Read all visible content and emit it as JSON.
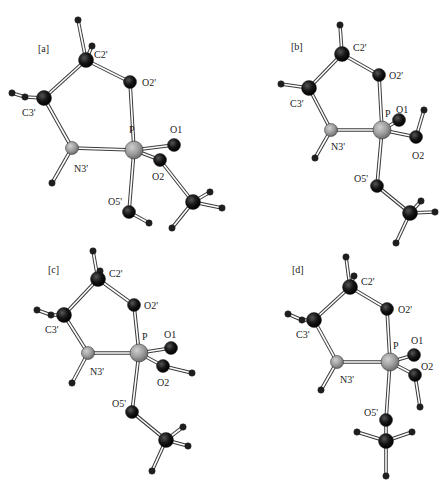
{
  "figure": {
    "colors": {
      "oxygen_carbon": "#111111",
      "nitrogen_phosphorus": "#9a9a9a",
      "hydrogen": "#222222",
      "bond_outline": "#444444",
      "bond_fill": "#ffffff"
    },
    "panels": [
      {
        "label": "[a]",
        "label_pos": [
          38,
          52
        ],
        "atoms": [
          {
            "id": "H1",
            "el": "H",
            "x": 78,
            "y": 20
          },
          {
            "id": "H2",
            "el": "H",
            "x": 92,
            "y": 46
          },
          {
            "id": "C2'",
            "el": "C",
            "x": 86,
            "y": 60,
            "label": "C2'",
            "lx": 94,
            "ly": 58
          },
          {
            "id": "O2'",
            "el": "O",
            "x": 130,
            "y": 82,
            "label": "O2'",
            "lx": 142,
            "ly": 86
          },
          {
            "id": "H3",
            "el": "H",
            "x": 12,
            "y": 93
          },
          {
            "id": "H4",
            "el": "H",
            "x": 25,
            "y": 97
          },
          {
            "id": "C3'",
            "el": "C",
            "x": 44,
            "y": 98,
            "label": "C3'",
            "lx": 22,
            "ly": 116
          },
          {
            "id": "N3'",
            "el": "N",
            "x": 72,
            "y": 148,
            "label": "N3'",
            "lx": 74,
            "ly": 172
          },
          {
            "id": "H5",
            "el": "H",
            "x": 52,
            "y": 183
          },
          {
            "id": "P",
            "el": "P",
            "x": 134,
            "y": 150,
            "label": "P",
            "lx": 129,
            "ly": 133
          },
          {
            "id": "O1",
            "el": "O",
            "x": 174,
            "y": 145,
            "label": "O1",
            "lx": 170,
            "ly": 133
          },
          {
            "id": "O2",
            "el": "O",
            "x": 160,
            "y": 160,
            "label": "O2",
            "lx": 152,
            "ly": 180
          },
          {
            "id": "O5'",
            "el": "O",
            "x": 129,
            "y": 212,
            "label": "O5'",
            "lx": 108,
            "ly": 205
          },
          {
            "id": "H6",
            "el": "H",
            "x": 149,
            "y": 223
          },
          {
            "id": "C",
            "el": "C",
            "x": 193,
            "y": 202
          },
          {
            "id": "H7",
            "el": "H",
            "x": 210,
            "y": 192
          },
          {
            "id": "H8",
            "el": "H",
            "x": 222,
            "y": 208
          },
          {
            "id": "H9",
            "el": "H",
            "x": 172,
            "y": 228
          }
        ],
        "bonds": [
          [
            "H1",
            "C2'"
          ],
          [
            "H2",
            "C2'"
          ],
          [
            "C2'",
            "O2'"
          ],
          [
            "C2'",
            "C3'"
          ],
          [
            "H3",
            "H4"
          ],
          [
            "H4",
            "C3'"
          ],
          [
            "C3'",
            "N3'"
          ],
          [
            "N3'",
            "P"
          ],
          [
            "N3'",
            "H5"
          ],
          [
            "O2'",
            "P"
          ],
          [
            "P",
            "O1"
          ],
          [
            "P",
            "O2"
          ],
          [
            "P",
            "O5'"
          ],
          [
            "O5'",
            "H6"
          ],
          [
            "O2",
            "C"
          ],
          [
            "C",
            "H7"
          ],
          [
            "C",
            "H8"
          ],
          [
            "C",
            "H9"
          ]
        ]
      },
      {
        "label": "[b]",
        "label_pos": [
          291,
          50
        ],
        "atoms": [
          {
            "id": "H1",
            "el": "H",
            "x": 340,
            "y": 25
          },
          {
            "id": "C2'",
            "el": "C",
            "x": 342,
            "y": 54,
            "label": "C2'",
            "lx": 353,
            "ly": 51
          },
          {
            "id": "O2'",
            "el": "O",
            "x": 379,
            "y": 75,
            "label": "O2'",
            "lx": 389,
            "ly": 79
          },
          {
            "id": "H2",
            "el": "H",
            "x": 281,
            "y": 84
          },
          {
            "id": "C3'",
            "el": "C",
            "x": 309,
            "y": 88,
            "label": "C3'",
            "lx": 290,
            "ly": 107
          },
          {
            "id": "N3'",
            "el": "N",
            "x": 331,
            "y": 130,
            "label": "N3'",
            "lx": 331,
            "ly": 150
          },
          {
            "id": "H3",
            "el": "H",
            "x": 315,
            "y": 158
          },
          {
            "id": "P",
            "el": "P",
            "x": 382,
            "y": 130,
            "label": "P",
            "lx": 385,
            "ly": 117
          },
          {
            "id": "O1",
            "el": "O",
            "x": 399,
            "y": 120,
            "label": "O1",
            "lx": 396,
            "ly": 113
          },
          {
            "id": "H4",
            "el": "H",
            "x": 424,
            "y": 110
          },
          {
            "id": "O2",
            "el": "O",
            "x": 416,
            "y": 137,
            "label": "O2",
            "lx": 412,
            "ly": 159
          },
          {
            "id": "O5'",
            "el": "O",
            "x": 377,
            "y": 186,
            "label": "O5'",
            "lx": 354,
            "ly": 182
          },
          {
            "id": "C",
            "el": "C",
            "x": 410,
            "y": 213
          },
          {
            "id": "H5",
            "el": "H",
            "x": 421,
            "y": 201
          },
          {
            "id": "H6",
            "el": "H",
            "x": 435,
            "y": 212
          },
          {
            "id": "H7",
            "el": "H",
            "x": 396,
            "y": 243
          }
        ],
        "bonds": [
          [
            "H1",
            "C2'"
          ],
          [
            "C2'",
            "O2'"
          ],
          [
            "C2'",
            "C3'"
          ],
          [
            "H2",
            "C3'"
          ],
          [
            "C3'",
            "N3'"
          ],
          [
            "N3'",
            "P"
          ],
          [
            "N3'",
            "H3"
          ],
          [
            "O2'",
            "P"
          ],
          [
            "P",
            "O1"
          ],
          [
            "P",
            "O2"
          ],
          [
            "O2",
            "H4"
          ],
          [
            "P",
            "O5'"
          ],
          [
            "O5'",
            "C"
          ],
          [
            "C",
            "H5"
          ],
          [
            "C",
            "H6"
          ],
          [
            "C",
            "H7"
          ]
        ]
      },
      {
        "label": "[c]",
        "label_pos": [
          48,
          273
        ],
        "atoms": [
          {
            "id": "H1",
            "el": "H",
            "x": 93,
            "y": 251
          },
          {
            "id": "H2",
            "el": "H",
            "x": 100,
            "y": 271
          },
          {
            "id": "C2'",
            "el": "C",
            "x": 98,
            "y": 279,
            "label": "C2'",
            "lx": 109,
            "ly": 277
          },
          {
            "id": "O2'",
            "el": "O",
            "x": 134,
            "y": 305,
            "label": "O2'",
            "lx": 144,
            "ly": 309
          },
          {
            "id": "H3",
            "el": "H",
            "x": 37,
            "y": 310
          },
          {
            "id": "H4",
            "el": "H",
            "x": 51,
            "y": 315
          },
          {
            "id": "C3'",
            "el": "C",
            "x": 64,
            "y": 315,
            "label": "C3'",
            "lx": 45,
            "ly": 333
          },
          {
            "id": "N3'",
            "el": "N",
            "x": 88,
            "y": 353,
            "label": "N3'",
            "lx": 90,
            "ly": 375
          },
          {
            "id": "H5",
            "el": "H",
            "x": 72,
            "y": 383
          },
          {
            "id": "P",
            "el": "P",
            "x": 139,
            "y": 353,
            "label": "P",
            "lx": 142,
            "ly": 340
          },
          {
            "id": "O1",
            "el": "O",
            "x": 171,
            "y": 348,
            "label": "O1",
            "lx": 164,
            "ly": 338
          },
          {
            "id": "O2",
            "el": "O",
            "x": 163,
            "y": 366,
            "label": "O2",
            "lx": 157,
            "ly": 386
          },
          {
            "id": "H6",
            "el": "H",
            "x": 192,
            "y": 373
          },
          {
            "id": "O5'",
            "el": "O",
            "x": 132,
            "y": 412,
            "label": "O5'",
            "lx": 112,
            "ly": 407
          },
          {
            "id": "C",
            "el": "C",
            "x": 166,
            "y": 440
          },
          {
            "id": "H7",
            "el": "H",
            "x": 183,
            "y": 427
          },
          {
            "id": "H8",
            "el": "H",
            "x": 188,
            "y": 446
          },
          {
            "id": "H9",
            "el": "H",
            "x": 152,
            "y": 471
          }
        ],
        "bonds": [
          [
            "H1",
            "C2'"
          ],
          [
            "H2",
            "C2'"
          ],
          [
            "C2'",
            "O2'"
          ],
          [
            "C2'",
            "C3'"
          ],
          [
            "H3",
            "H4"
          ],
          [
            "H4",
            "C3'"
          ],
          [
            "C3'",
            "N3'"
          ],
          [
            "N3'",
            "P"
          ],
          [
            "N3'",
            "H5"
          ],
          [
            "O2'",
            "P"
          ],
          [
            "P",
            "O1"
          ],
          [
            "P",
            "O2"
          ],
          [
            "O2",
            "H6"
          ],
          [
            "P",
            "O5'"
          ],
          [
            "O5'",
            "C"
          ],
          [
            "C",
            "H7"
          ],
          [
            "C",
            "H8"
          ],
          [
            "C",
            "H9"
          ]
        ]
      },
      {
        "label": "[d]",
        "label_pos": [
          292,
          273
        ],
        "atoms": [
          {
            "id": "H1",
            "el": "H",
            "x": 346,
            "y": 257
          },
          {
            "id": "H2",
            "el": "H",
            "x": 354,
            "y": 276
          },
          {
            "id": "C2'",
            "el": "C",
            "x": 350,
            "y": 287,
            "label": "C2'",
            "lx": 361,
            "ly": 285
          },
          {
            "id": "O2'",
            "el": "O",
            "x": 387,
            "y": 309,
            "label": "O2'",
            "lx": 398,
            "ly": 313
          },
          {
            "id": "H3",
            "el": "H",
            "x": 288,
            "y": 314
          },
          {
            "id": "H4",
            "el": "H",
            "x": 302,
            "y": 320
          },
          {
            "id": "C3'",
            "el": "C",
            "x": 314,
            "y": 320,
            "label": "C3'",
            "lx": 296,
            "ly": 338
          },
          {
            "id": "N3'",
            "el": "N",
            "x": 337,
            "y": 362,
            "label": "N3'",
            "lx": 340,
            "ly": 383
          },
          {
            "id": "H5",
            "el": "H",
            "x": 321,
            "y": 390
          },
          {
            "id": "P",
            "el": "P",
            "x": 390,
            "y": 362,
            "label": "P",
            "lx": 393,
            "ly": 349
          },
          {
            "id": "O1",
            "el": "O",
            "x": 414,
            "y": 355,
            "label": "O1",
            "lx": 411,
            "ly": 344
          },
          {
            "id": "O2",
            "el": "O",
            "x": 415,
            "y": 375,
            "label": "O2",
            "lx": 421,
            "ly": 370
          },
          {
            "id": "H6",
            "el": "H",
            "x": 420,
            "y": 407
          },
          {
            "id": "O5'",
            "el": "O",
            "x": 386,
            "y": 420,
            "label": "O5'",
            "lx": 364,
            "ly": 416
          },
          {
            "id": "C",
            "el": "C",
            "x": 386,
            "y": 441
          },
          {
            "id": "H7",
            "el": "H",
            "x": 357,
            "y": 432
          },
          {
            "id": "H8",
            "el": "H",
            "x": 412,
            "y": 432
          },
          {
            "id": "H9",
            "el": "H",
            "x": 386,
            "y": 476
          }
        ],
        "bonds": [
          [
            "H1",
            "C2'"
          ],
          [
            "H2",
            "C2'"
          ],
          [
            "C2'",
            "O2'"
          ],
          [
            "C2'",
            "C3'"
          ],
          [
            "H3",
            "H4"
          ],
          [
            "H4",
            "C3'"
          ],
          [
            "C3'",
            "N3'"
          ],
          [
            "N3'",
            "P"
          ],
          [
            "N3'",
            "H5"
          ],
          [
            "O2'",
            "P"
          ],
          [
            "P",
            "O1"
          ],
          [
            "P",
            "O2"
          ],
          [
            "O2",
            "H6"
          ],
          [
            "P",
            "O5'"
          ],
          [
            "O5'",
            "C"
          ],
          [
            "C",
            "H7"
          ],
          [
            "C",
            "H8"
          ],
          [
            "C",
            "H9"
          ]
        ]
      }
    ]
  }
}
